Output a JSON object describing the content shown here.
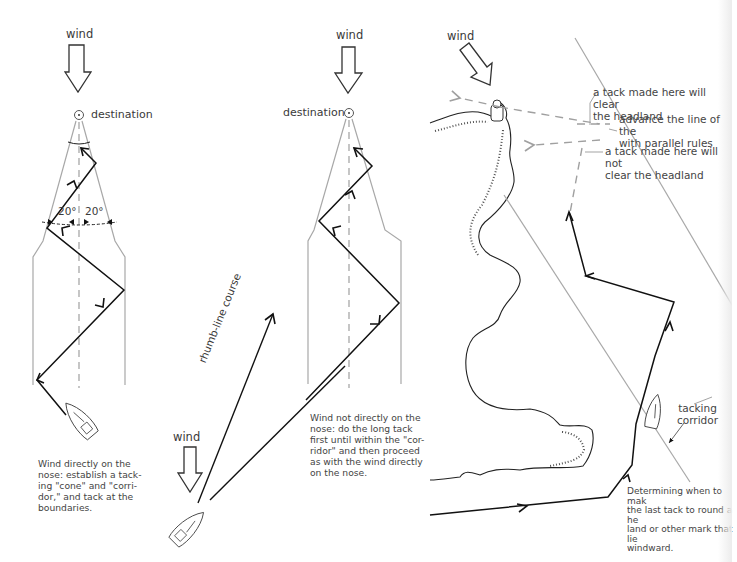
{
  "colors": {
    "course_line": "#111111",
    "boundary_line": "#a8a8a8",
    "dashed_line": "#a0a0a0",
    "text": "#3a3a3a"
  },
  "panel_1": {
    "wind_label": "wind",
    "destination_label": "destination",
    "angle_left": "20°",
    "angle_right": "20°",
    "caption": "Wind directly on the\nnose: establish a tack-\ning \"cone\" and \"corri-\ndor,\" and tack at the\nboundaries."
  },
  "panel_2": {
    "wind_label": "wind",
    "rhumb_line_label": "rhumb-line course"
  },
  "panel_3": {
    "wind_label": "wind",
    "destination_label": "destination",
    "caption": "Wind not directly on the\nnose: do the long tack\nfirst until within the \"cor-\nridor\" and then proceed\nas with the wind directly\non the nose."
  },
  "panel_4": {
    "wind_label": "wind",
    "annotation_clear": "a tack made here will clear\nthe headland",
    "annotation_advance": "advance the line of the\nwith parallel rules",
    "annotation_not_clear": "a tack made here will not\nclear the headland",
    "corridor_label": "tacking\ncorridor",
    "caption": "Determining when to mak\nthe last tack to round a he\nland or other mark that lie\nwindward."
  }
}
